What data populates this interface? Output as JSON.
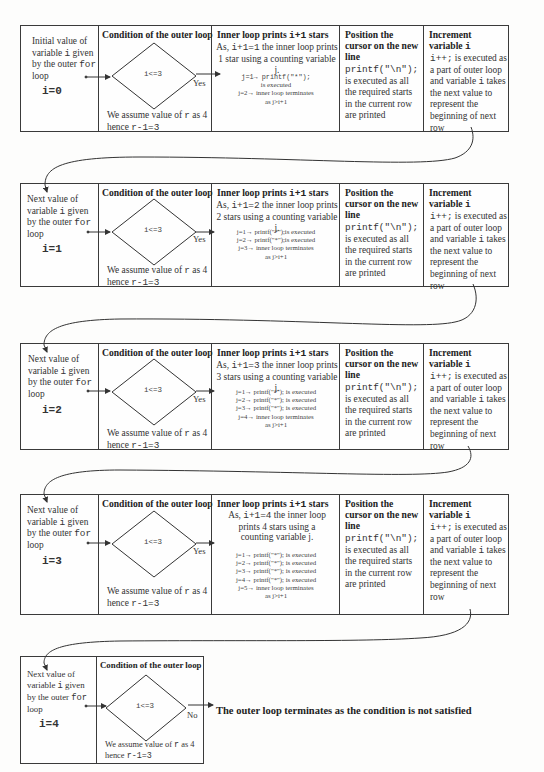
{
  "headers": {
    "condition": "Condition of the outer  loop",
    "inner_prefix": "Inner loop prints ",
    "inner_code": "i+1",
    "inner_suffix": " stars",
    "position": "Position the cursor on the new line",
    "increment_prefix": "Increment variable ",
    "increment_code": "i"
  },
  "common": {
    "condition_expr": "i<=3",
    "yes_label": "Yes",
    "no_label": "No",
    "assume_line1_a": "We assume value of ",
    "assume_line1_code": "r",
    "assume_line1_b": " as 4",
    "assume_line2_a": "hence ",
    "assume_line2_code": "r-1=3",
    "position_code": "printf(\"\\n\");",
    "position_tail": " is executed as all the required starts in the current row are printed",
    "increment_code": "i++;",
    "increment_body_a": " is executed as a part of outer loop and variable ",
    "increment_body_code": "i",
    "increment_body_b": " takes the next value to represent the beginning of next row"
  },
  "blocks": [
    {
      "intro_a": "Initial value of variable ",
      "intro_code": "i",
      "intro_b": " given by the outer ",
      "intro_code2": "for",
      "intro_c": " loop",
      "i_value": "i=0",
      "inner_desc_a": "As, ",
      "inner_desc_code": "i+1=1",
      "inner_desc_b": "  the inner loop prints 1 star using a counting variable j.",
      "steps": [
        "j=1→ printf(\"*\");",
        "is executed",
        "j=2→ inner loop terminates",
        "as j>i+1"
      ]
    },
    {
      "intro_a": "Next value of variable ",
      "intro_code": "i",
      "intro_b": " given by the outer ",
      "intro_code2": "for",
      "intro_c": " loop",
      "i_value": "i=1",
      "inner_desc_a": "As, ",
      "inner_desc_code": "i+1=2",
      "inner_desc_b": " the inner loop prints 2 stars using a counting variable j.",
      "steps": [
        "j=1→ printf(\"*\");is executed",
        "j=2→ printf(\"*\");is executed",
        "j=3→ inner loop terminates",
        "as j>i+1"
      ]
    },
    {
      "intro_a": "Next value of variable ",
      "intro_code": "i",
      "intro_b": " given by the outer ",
      "intro_code2": "for",
      "intro_c": " loop",
      "i_value": "i=2",
      "inner_desc_a": "As, ",
      "inner_desc_code": "i+1=3",
      "inner_desc_b": " the inner loop prints 3 stars using a counting variable j.",
      "steps": [
        "j=1→ printf(\"*\"); is executed",
        "j=2→ printf(\"*\"); is executed",
        "j=3→ printf(\"*\"); is executed",
        "j=4→ inner loop terminates",
        "as j>i+1"
      ]
    },
    {
      "intro_a": "Next value of variable ",
      "intro_code": "i",
      "intro_b": " given by the outer ",
      "intro_code2": "for",
      "intro_c": " loop",
      "i_value": "i=3",
      "inner_desc_a": "As, ",
      "inner_desc_code": "i+1=4",
      "inner_desc_b": " the inner loop prints 4 stars using a counting variable j.",
      "steps": [
        "j=1→ printf(\"*\"); is executed",
        "j=2→ printf(\"*\"); is executed",
        "j=3→ printf(\"*\"); is executed",
        "j=4→ printf(\"*\"); is executed",
        "j=5→ inner loop terminates",
        "as j>i+1"
      ]
    },
    {
      "intro_a": "Next value of variable ",
      "intro_code": "i",
      "intro_b": " given by the outer ",
      "intro_code2": "for",
      "intro_c": " loop",
      "i_value": "i=4"
    }
  ],
  "final": {
    "terminate_text": "The outer loop terminates as the condition is not satisfied"
  }
}
